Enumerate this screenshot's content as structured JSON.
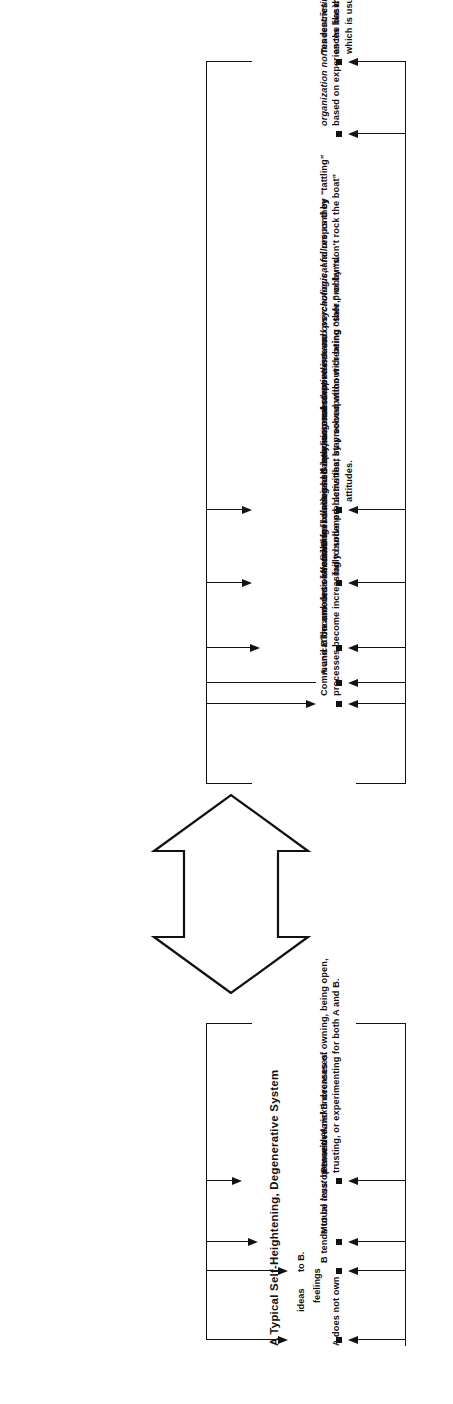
{
  "figure": {
    "title": "A Typical Self-Heightening, Degenerative System",
    "type": "causal-loop-diagram",
    "orientation": "page rotated 90 degrees (text reads bottom-to-top)",
    "ink_color": "#111111",
    "background_color": "#ffffff"
  },
  "lower_group": {
    "name": "interpersonal-consequences",
    "items": [
      {
        "id": "a-does-not-own",
        "lead": "A does not own",
        "stacked": [
          "ideas",
          "feelings"
        ],
        "tail": "to B."
      },
      {
        "id": "b-less-open",
        "text": "B tends to be less open with A.",
        "italic": ""
      },
      {
        "id": "mutual-trust",
        "text": "Mutual trust between A and B decreases.",
        "italic": "trust"
      },
      {
        "id": "perceived-risk",
        "text": "Perceived risk increases of owning, being open,\ntrusting, or experimenting for both A and B.",
        "italic": "risk"
      }
    ]
  },
  "upper_group": {
    "name": "organizational-consequences",
    "items": [
      {
        "id": "communication-burdened",
        "text": "Communication and decision-making\nprocesses become increasingly burdened."
      },
      {
        "id": "less-effective-isolating",
        "text": "A and B become less effective in isolating and resolving substantive issues.",
        "italic": "in isolating and resolving substantive issues."
      },
      {
        "id": "unfinished-business",
        "text": "The amount of unfinished business sharply increases.",
        "italic": "unfinished business"
      },
      {
        "id": "diminished-competence",
        "text": "A and B feel diminished interpersonal competence and psychological failure as they\nfail to solve problems that stay solved without creating other problems.",
        "italic": "interpersonal competence and psychological failure"
      },
      {
        "id": "dependent-overcautious",
        "text": "A and B become more dependent and overcautious, and respond by “tattling”\nactivities, by preoccupation with being “safe,” or by “don't rock the boat”\nattitudes.",
        "italic": "dependent and overcautious"
      },
      {
        "id": "restrictive-norms",
        "text": "organization norms restricting owning and openness are reinforced or developed\nbased on experiences like those of A and B.",
        "italic": "organization norms restricting owning and openness"
      },
      {
        "id": "fragmentation-tendencies",
        "text": "Tendencies toward fragmentation of organization units are enhanced, particularly\nas the basic organizing model uses functional or processual departmentalization,\nwhich is usually the case.",
        "italic": "fragmentation"
      }
    ]
  },
  "connector": {
    "name": "bidirectional-reinforcing-arrow",
    "description": "large hollow double-headed arrow linking the two consequence groups"
  }
}
